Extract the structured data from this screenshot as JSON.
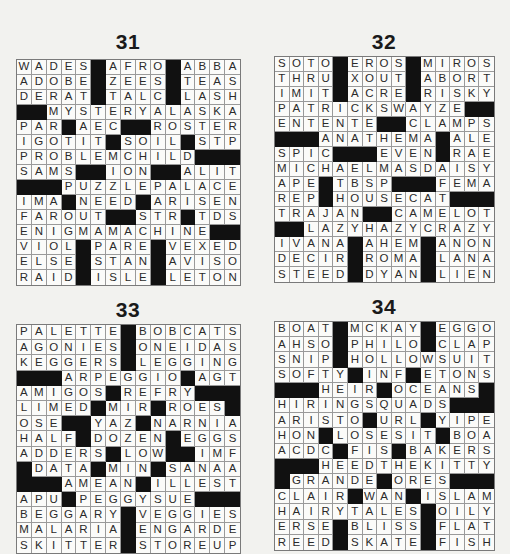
{
  "page": {
    "background": "#f2f2ef",
    "black_square_color": "#111111"
  },
  "puzzles": [
    {
      "number": "31",
      "rows": [
        "WADES#AFRO#ABBA",
        "ADOBE#ZEES#TEAS",
        "DERAT#TALC#LASH",
        "##MYSTERYALASKA",
        "PAR#AEC##ROSTER",
        "IGOTIT#SOIL#STP",
        "PROBLEMCHILD###",
        "SAMS##ION##ALIT",
        "###PUZZLEPALACE",
        "IMA#NEED#ARISEN",
        "FAROUT##STR#TDS",
        "ENIGMAMACHINE##",
        "VIOL#PARE#VEXED",
        "ELSE#STAN#AVISO",
        "RAID#ISLE#LETON"
      ]
    },
    {
      "number": "32",
      "rows": [
        "SOTO#EROS#MIROS",
        "THRU#XOUT#ABORT",
        "IMIT#ACRE#RISKY",
        "PATRICKSWAYZE##",
        "ENTENTE##CLAMPS",
        "###ANATHEMA#ALE",
        "SPIC###EVEN#RAE",
        "MICHAELMASDAISY",
        "APE#TBSP###FEMA",
        "REP#HOUSECAT###",
        "TRAJAN##CAMELOT",
        "##LAZYHAZYCRAZY",
        "IVANA#AHEM#ANON",
        "DECIR#ROMA#LANA",
        "STEED#DYAN#LIEN"
      ]
    },
    {
      "number": "33",
      "rows": [
        "PALETTE#BOBCATS",
        "AGONIES#ONEIDAS",
        "KEGGERS#LEGGING",
        "###ARPEGGIO#AGT",
        "AMIGOS#REFRY###",
        "LIMED#MIR#ROES#",
        "OSE##YAZ#NARNIA",
        "HALF#DOZEN#EGGS",
        "ADDERS#LOW##IMF",
        "#DATA#MIN#SANAA",
        "###AMEAN#ILLEST",
        "APU#PEGGYSUE###",
        "BEGGARY#VEGGIES",
        "MALARIA#ENGARDE",
        "SKITTER#STOREUP"
      ]
    },
    {
      "number": "34",
      "rows": [
        "BOAT#MCKAY#EGGO",
        "AHSO#PHILO#CLAP",
        "SNIP#HOLLOWSUIT",
        "SOFTY#INF#ETONS",
        "###HEIR#OCEANS#",
        "HIRINGSQUADS###",
        "ARISTO#URL#YIPE",
        "HON#LOSESIT#BOA",
        "ACDC#FIS#BAKERS",
        "###HEEDTHEKITTY",
        "#GRANDE#ORES###",
        "CLAIR#WAN#ISLAM",
        "HAIRYTALES#OILY",
        "ERSE#BLISS#FLAT",
        "REED#SKATE#FISH"
      ]
    }
  ]
}
